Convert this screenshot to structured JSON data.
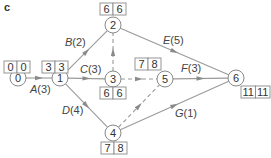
{
  "panel_label": "c",
  "colors": {
    "line": "#9a9a9a",
    "text": "#333333",
    "box_border": "#8a8a8a"
  },
  "nodes": [
    {
      "id": "0",
      "x": 18,
      "y": 78,
      "early": "0",
      "late": "0",
      "box": {
        "x": 4,
        "y": 61
      }
    },
    {
      "id": "1",
      "x": 60,
      "y": 78,
      "early": "3",
      "late": "3",
      "box": {
        "x": 42,
        "y": 61
      }
    },
    {
      "id": "2",
      "x": 113,
      "y": 25,
      "early": "6",
      "late": "6",
      "box": {
        "x": 100,
        "y": 3
      }
    },
    {
      "id": "3",
      "x": 113,
      "y": 79,
      "early": "6",
      "late": "6",
      "box": {
        "x": 100,
        "y": 87
      }
    },
    {
      "id": "4",
      "x": 113,
      "y": 133,
      "early": "7",
      "late": "8",
      "box": {
        "x": 101,
        "y": 142
      }
    },
    {
      "id": "5",
      "x": 165,
      "y": 79,
      "early": "7",
      "late": "8",
      "box": {
        "x": 135,
        "y": 58
      }
    },
    {
      "id": "6",
      "x": 236,
      "y": 78,
      "early": "11",
      "late": "11",
      "box": {
        "x": 241,
        "y": 86
      }
    }
  ],
  "edges": [
    {
      "from": "0",
      "to": "1",
      "letter": "A",
      "duration": "(3)",
      "dashed": false,
      "label_x": 30,
      "label_y": 93
    },
    {
      "from": "1",
      "to": "2",
      "letter": "B",
      "duration": "(2)",
      "dashed": false,
      "label_x": 65,
      "label_y": 46
    },
    {
      "from": "1",
      "to": "3",
      "letter": "C",
      "duration": "(3)",
      "dashed": false,
      "label_x": 80,
      "label_y": 73
    },
    {
      "from": "1",
      "to": "4",
      "letter": "D",
      "duration": "(4)",
      "dashed": false,
      "label_x": 62,
      "label_y": 114
    },
    {
      "from": "2",
      "to": "6",
      "letter": "E",
      "duration": "(5)",
      "dashed": false,
      "label_x": 163,
      "label_y": 44
    },
    {
      "from": "5",
      "to": "6",
      "letter": "F",
      "duration": "(3)",
      "dashed": false,
      "label_x": 181,
      "label_y": 72
    },
    {
      "from": "4",
      "to": "6",
      "letter": "G",
      "duration": "(1)",
      "dashed": false,
      "label_x": 175,
      "label_y": 117
    },
    {
      "from": "3",
      "to": "2",
      "letter": "",
      "duration": "",
      "dashed": true
    },
    {
      "from": "3",
      "to": "5",
      "letter": "",
      "duration": "",
      "dashed": true
    },
    {
      "from": "4",
      "to": "5",
      "letter": "",
      "duration": "",
      "dashed": true
    }
  ]
}
